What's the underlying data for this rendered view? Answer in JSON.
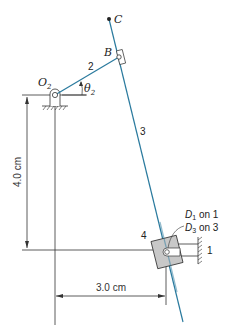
{
  "labels": {
    "point_c": "C",
    "point_b": "B",
    "pivot_o2": "O",
    "pivot_o2_sub": "2",
    "angle": "θ",
    "angle_sub": "2",
    "link_2": "2",
    "link_3": "3",
    "link_4": "4",
    "link_1": "1",
    "d1_label": "D",
    "d1_sub": "1",
    "d1_suffix": " on 1",
    "d3_label": "D",
    "d3_sub": "3",
    "d3_suffix": " on 3"
  },
  "dimensions": {
    "vertical": "4.0 cm",
    "horizontal": "3.0 cm"
  },
  "colors": {
    "link": "#2a7a9e",
    "line": "#333333",
    "block_fill": "#c8c8c8"
  }
}
